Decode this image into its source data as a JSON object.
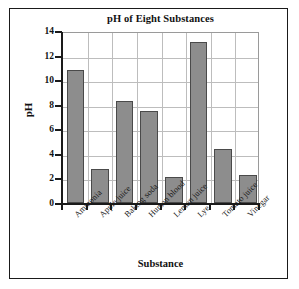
{
  "figure": {
    "background_color": "#ffffff",
    "frame_color": "#1a1a1a"
  },
  "chart_data": {
    "type": "bar",
    "title": "pH of Eight Substances",
    "xlabel": "Substance",
    "ylabel": "pH",
    "categories": [
      "Ammonia",
      "Apple juice",
      "Baking soda",
      "Human blood",
      "Lemon juice",
      "Lye",
      "Tomato juice",
      "Vinegar"
    ],
    "values": [
      10.8,
      2.8,
      8.3,
      7.5,
      2.1,
      13.1,
      4.4,
      2.3
    ],
    "ylim": [
      0,
      14
    ],
    "yticks": [
      0,
      2,
      4,
      6,
      8,
      10,
      12,
      14
    ],
    "ytick_labels": [
      "0",
      "2",
      "4",
      "6",
      "8",
      "10",
      "12",
      "14"
    ],
    "grid": true,
    "legend": false,
    "bar_color": "#8d8d8d",
    "bar_edge_color": "#4a4a4a",
    "grid_color": "#bdbdbd"
  }
}
